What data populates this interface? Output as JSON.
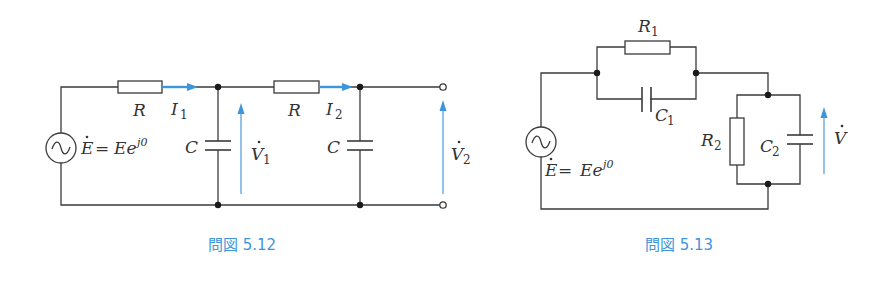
{
  "figures": [
    {
      "id": "5.12",
      "caption": "問図 5.12",
      "source": {
        "label_main": "E",
        "label_eq": "=",
        "label_rhs": "Ee",
        "label_sup": "j0"
      },
      "components": {
        "resistor1": {
          "label": "R"
        },
        "current1": {
          "label": "I",
          "sub": "1"
        },
        "capacitor1": {
          "label": "C"
        },
        "voltage1": {
          "label": "V",
          "sub": "1"
        },
        "resistor2": {
          "label": "R"
        },
        "current2": {
          "label": "I",
          "sub": "2"
        },
        "capacitor2": {
          "label": "C"
        },
        "voltage2": {
          "label": "V",
          "sub": "2"
        }
      }
    },
    {
      "id": "5.13",
      "caption": "問図 5.13",
      "source": {
        "label_main": "E",
        "label_eq": "=",
        "label_rhs": "Ee",
        "label_sup": "j0"
      },
      "components": {
        "resistor1": {
          "label": "R",
          "sub": "1"
        },
        "capacitor1": {
          "label": "C",
          "sub": "1"
        },
        "resistor2": {
          "label": "R",
          "sub": "2"
        },
        "capacitor2": {
          "label": "C",
          "sub": "2"
        },
        "voltage": {
          "label": "V"
        }
      }
    }
  ],
  "colors": {
    "accent": "#3d96dc",
    "wire": "#3a3a3a"
  }
}
